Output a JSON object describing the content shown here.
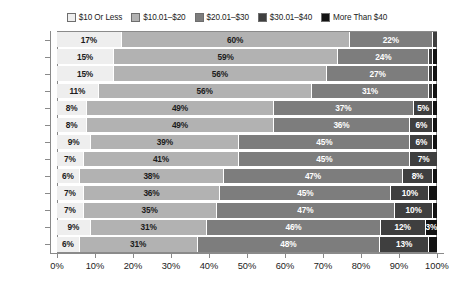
{
  "chart_data": {
    "type": "bar",
    "orientation": "horizontal",
    "stacked": true,
    "normalized_percent": true,
    "title": "",
    "subtitle": "",
    "xlabel": "",
    "ylabel": "",
    "xlim": [
      0,
      100
    ],
    "xticks": [
      "0%",
      "10%",
      "20%",
      "30%",
      "40%",
      "50%",
      "60%",
      "70%",
      "80%",
      "90%",
      "100%"
    ],
    "xtick_values": [
      0,
      10,
      20,
      30,
      40,
      50,
      60,
      70,
      80,
      90,
      100
    ],
    "grid": false,
    "legend_position": "top",
    "categories": [
      "2006",
      "2007",
      "2008",
      "2009",
      "2010*",
      "2011",
      "2012*",
      "2013",
      "2014",
      "2015",
      "2016",
      "2017",
      "2018"
    ],
    "series": [
      {
        "name": "$10 Or Less",
        "color": "#eeeeee",
        "label_color": "#1b1b1b",
        "values": [
          17,
          15,
          15,
          11,
          8,
          8,
          9,
          7,
          6,
          7,
          7,
          9,
          6
        ],
        "labels": [
          "17%",
          "15%",
          "15%",
          "11%",
          "8%",
          "8%",
          "9%",
          "7%",
          "6%",
          "7%",
          "7%",
          "9%",
          "6%"
        ]
      },
      {
        "name": "$10.01–$20",
        "color": "#b2b2b2",
        "label_color": "#1b1b1b",
        "values": [
          60,
          59,
          56,
          56,
          49,
          49,
          39,
          41,
          38,
          36,
          35,
          31,
          31
        ],
        "labels": [
          "60%",
          "59%",
          "56%",
          "56%",
          "49%",
          "49%",
          "39%",
          "41%",
          "38%",
          "36%",
          "35%",
          "31%",
          "31%"
        ]
      },
      {
        "name": "$20.01–$30",
        "color": "#7d7d7d",
        "label_color": "#ffffff",
        "values": [
          22,
          24,
          27,
          31,
          37,
          36,
          45,
          45,
          47,
          45,
          47,
          46,
          48
        ],
        "labels": [
          "22%",
          "24%",
          "27%",
          "31%",
          "37%",
          "36%",
          "45%",
          "45%",
          "47%",
          "45%",
          "47%",
          "46%",
          "48%"
        ]
      },
      {
        "name": "$30.01–$40",
        "color": "#3f3f3f",
        "label_color": "#ffffff",
        "values": [
          1,
          1,
          1,
          1,
          5,
          6,
          6,
          7,
          8,
          10,
          10,
          12,
          13
        ],
        "labels": [
          "",
          "",
          "",
          "",
          "5%",
          "6%",
          "6%",
          "7%",
          "8%",
          "10%",
          "10%",
          "12%",
          "13%"
        ]
      },
      {
        "name": "More Than $40",
        "color": "#131313",
        "label_color": "#ffffff",
        "values": [
          0,
          1,
          1,
          1,
          1,
          1,
          1,
          0,
          1,
          2,
          1,
          3,
          2
        ],
        "labels": [
          "",
          "",
          "",
          "",
          "",
          "",
          "",
          "",
          "",
          "",
          "",
          "3%",
          ""
        ]
      }
    ]
  }
}
